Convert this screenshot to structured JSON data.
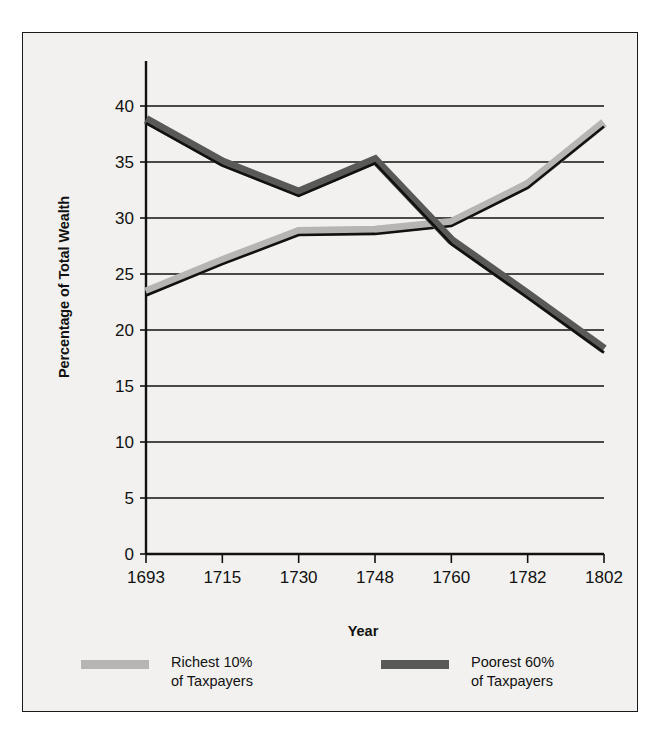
{
  "chart_data": {
    "type": "line",
    "title": "",
    "xlabel": "Year",
    "ylabel": "Percentage of Total Wealth",
    "categories": [
      "1693",
      "1715",
      "1730",
      "1748",
      "1760",
      "1782",
      "1802"
    ],
    "ylim": [
      0,
      40
    ],
    "yticks": [
      0,
      5,
      10,
      15,
      20,
      25,
      30,
      35,
      40
    ],
    "ytick_labels": [
      "0",
      "5",
      "10",
      "15",
      "20",
      "25",
      "30",
      "35",
      "40"
    ],
    "grid": true,
    "grid_axis": "y",
    "legend_position": "bottom",
    "series": [
      {
        "name": "Richest 10%\nof Taxpayers",
        "name_line1": "Richest 10%",
        "name_line2": "of Taxpayers",
        "color": "#b6b5b3",
        "values": [
          23.4,
          26.2,
          28.8,
          28.9,
          29.6,
          33.0,
          38.5
        ]
      },
      {
        "name": "Poorest 60%\nof Taxpayers",
        "name_line1": "Poorest 60%",
        "name_line2": "of Taxpayers",
        "color": "#595957",
        "values": [
          38.8,
          35.0,
          32.3,
          35.2,
          28.0,
          23.2,
          18.3
        ]
      }
    ]
  },
  "axes": {
    "y_title": "Percentage of Total Wealth",
    "x_title": "Year"
  },
  "legend": {
    "items": [
      {
        "label_line1": "Richest 10%",
        "label_line2": "of Taxpayers",
        "color": "#b6b5b3"
      },
      {
        "label_line1": "Poorest 60%",
        "label_line2": "of Taxpayers",
        "color": "#595957"
      }
    ]
  },
  "style": {
    "background": "#f2f1ef",
    "border_color": "#1a1a1a",
    "axis_color": "#111111",
    "grid_color": "#111111"
  }
}
